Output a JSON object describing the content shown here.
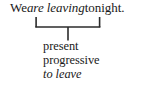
{
  "figure": {
    "type": "grammar-annotation-diagram",
    "background_color": "#ffffff",
    "text_color": "#1a1a1a",
    "rule_color": "#2b2b2b"
  },
  "sentence": {
    "full_text": "We are leaving tonight.",
    "parts": {
      "before": "We",
      "highlighted": "are leaving",
      "after": "tonight."
    },
    "highlighted_style": "italic"
  },
  "bracket": {
    "name": "underbrace-bracket",
    "shape": "u-bracket-with-stem",
    "spans_text": "are leaving"
  },
  "labels": {
    "lines": [
      {
        "text": "present",
        "style": "roman"
      },
      {
        "text": "progressive",
        "style": "roman"
      },
      {
        "text": "to leave",
        "style": "italic"
      }
    ]
  }
}
